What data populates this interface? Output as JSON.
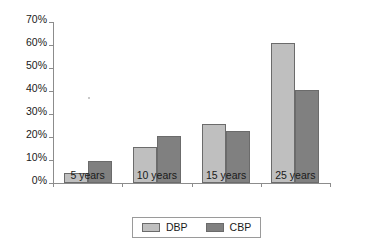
{
  "chart_data": {
    "type": "bar",
    "title": "",
    "subtitle": "",
    "xlabel": "",
    "ylabel": "",
    "categories": [
      "5 years",
      "10 years",
      "15 years",
      "25 years"
    ],
    "series": [
      {
        "name": "DBP",
        "color": "#bfbfbf",
        "values": [
          4.5,
          15.5,
          25.5,
          61
        ]
      },
      {
        "name": "CBP",
        "color": "#808080",
        "values": [
          9.5,
          20.5,
          22.5,
          40.5
        ]
      }
    ],
    "ylim": [
      0,
      70
    ],
    "ytick_values": [
      0,
      10,
      20,
      30,
      40,
      50,
      60,
      70
    ],
    "ytick_labels": [
      "0%",
      "10%",
      "20%",
      "30%",
      "40%",
      "50%",
      "60%",
      "70%"
    ],
    "grid": false,
    "legend": {
      "position": "bottom",
      "bordered": true,
      "entries": [
        {
          "label": "DBP",
          "color": "#bfbfbf"
        },
        {
          "label": "CBP",
          "color": "#808080"
        }
      ]
    },
    "axis_color": "#8c8c8c",
    "bar_border_color": "#6b6b6b",
    "background": "#ffffff"
  }
}
